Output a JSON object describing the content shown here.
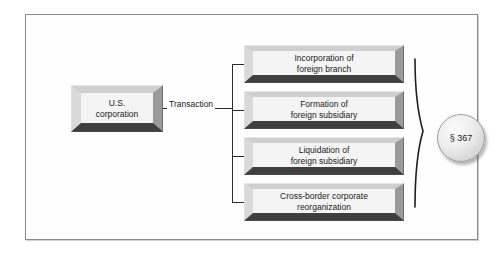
{
  "figure": {
    "background_color": "#ffffff",
    "frame_border_color": "#8a8a8a"
  },
  "source": {
    "label_line1": "U.S.",
    "label_line2": "corporation",
    "name": "us-corporation-node"
  },
  "connector": {
    "label": "Transaction"
  },
  "transactions": [
    {
      "line1": "Incorporation of",
      "line2": "foreign branch"
    },
    {
      "line1": "Formation of",
      "line2": "foreign subsidiary"
    },
    {
      "line1": "Liquidation of",
      "line2": "foreign subsidiary"
    },
    {
      "line1": "Cross-border corporate",
      "line2": "reorganization"
    }
  ],
  "result": {
    "label": "§ 367",
    "brace": "right-curly-brace"
  }
}
